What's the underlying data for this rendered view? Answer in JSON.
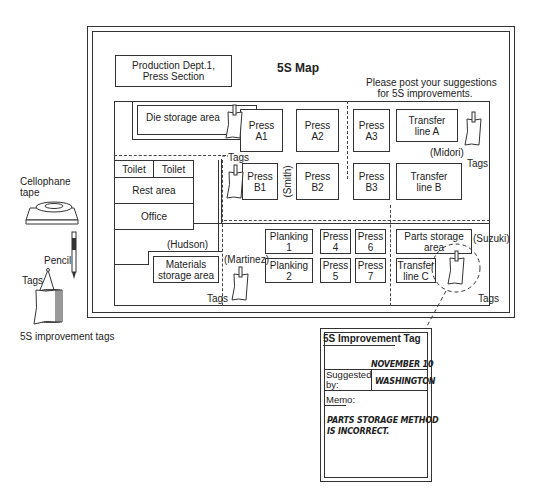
{
  "map": {
    "title": "5S Map",
    "department_line1": "Production Dept.1,",
    "department_line2": "Press Section",
    "notice_line1": "Please post your suggestions",
    "notice_line2": "for 5S improvements.",
    "areas": {
      "die_storage": "Die storage area",
      "press_a1": [
        "Press",
        "A1"
      ],
      "press_a2": [
        "Press",
        "A2"
      ],
      "press_a3": [
        "Press",
        "A3"
      ],
      "transfer_a": [
        "Transfer",
        "line A"
      ],
      "toilet1": "Toilet",
      "toilet2": "Toilet",
      "rest_area": "Rest area",
      "office": "Office",
      "press_b1": [
        "Press",
        "B1"
      ],
      "press_b2": [
        "Press",
        "B2"
      ],
      "press_b3": [
        "Press",
        "B3"
      ],
      "transfer_b": [
        "Transfer",
        "line B"
      ],
      "materials_storage": [
        "Materials",
        "storage area"
      ],
      "planking1": [
        "Planking",
        "1"
      ],
      "planking2": [
        "Planking",
        "2"
      ],
      "press4": [
        "Press",
        "4"
      ],
      "press5": [
        "Press",
        "5"
      ],
      "press6": [
        "Press",
        "6"
      ],
      "press7": [
        "Press",
        "7"
      ],
      "parts_storage": [
        "Parts storage",
        "area"
      ],
      "transfer_c": [
        "Transfer",
        "line C"
      ]
    },
    "people": {
      "smith": "(Smith)",
      "midori": "(Midori)",
      "hudson": "(Hudson)",
      "martinez": "(Martinez)",
      "suzuki": "(Suzuki)"
    },
    "tags_label": "Tags"
  },
  "supplies": {
    "cellophane_line1": "Cellophane",
    "cellophane_line2": "tape",
    "pencil": "Pencil",
    "tags": "Tags",
    "caption": "5S improvement tags"
  },
  "tag_card": {
    "title": "5S Improvement Tag",
    "date": "NOVEMBER 10",
    "suggested_label_line1": "Suggested",
    "suggested_label_line2": "by:",
    "suggested_value": "WASHINGTON",
    "memo_label": "Memo:",
    "memo_line1": "PARTS STORAGE METHOD",
    "memo_line2": "IS INCORRECT."
  }
}
